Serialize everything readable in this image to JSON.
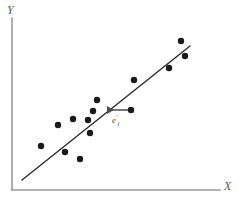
{
  "figure": {
    "background_color": "#ffffff",
    "width": 238,
    "height": 206
  },
  "axes": {
    "y_label": "Y",
    "x_label": "X",
    "axis_color": "#9a9a9a",
    "origin_x": 12,
    "origin_y": 190,
    "y_axis_top": 18,
    "x_axis_right": 220
  },
  "annotation": {
    "label_base": "e",
    "label_sub": "i",
    "label_sup": "′",
    "color": "#4a4a4a",
    "arrow_from_x": 131,
    "arrow_from_y": 110,
    "arrow_to_x": 104,
    "arrow_to_y": 110,
    "label_x": 112,
    "label_y": 114
  },
  "chart_data": {
    "type": "scatter",
    "title": "",
    "xlabel": "X",
    "ylabel": "Y",
    "grid": false,
    "legend": "none",
    "axis_ticks": [],
    "xlim": [
      12,
      220
    ],
    "ylim": [
      18,
      190
    ],
    "point_color": "#1a1a1a",
    "point_radius": 3.2,
    "points": [
      {
        "x": 41,
        "y": 146
      },
      {
        "x": 58,
        "y": 125
      },
      {
        "x": 65,
        "y": 152
      },
      {
        "x": 73,
        "y": 119
      },
      {
        "x": 80,
        "y": 159
      },
      {
        "x": 88,
        "y": 120
      },
      {
        "x": 93,
        "y": 111
      },
      {
        "x": 90,
        "y": 133
      },
      {
        "x": 97,
        "y": 100
      },
      {
        "x": 131,
        "y": 110
      },
      {
        "x": 134,
        "y": 80
      },
      {
        "x": 169,
        "y": 68
      },
      {
        "x": 181,
        "y": 41
      },
      {
        "x": 185,
        "y": 56
      }
    ],
    "fit_line": {
      "name": "regression line",
      "color": "#2a2a2a",
      "width": 1.4,
      "x1": 22,
      "y1": 180,
      "x2": 190,
      "y2": 46
    },
    "residual_annotation": {
      "label": "e′i",
      "description": "horizontal residual from fitted line to observed point",
      "point_x": 131,
      "point_y": 110,
      "line_x": 104,
      "line_y": 110
    }
  }
}
